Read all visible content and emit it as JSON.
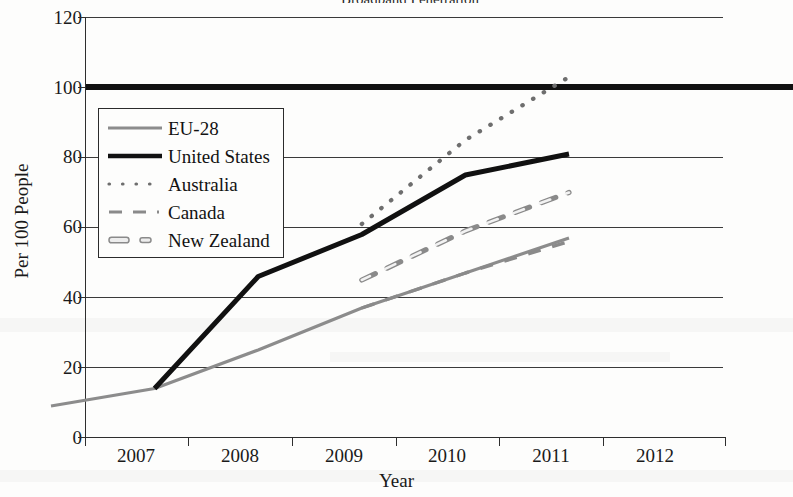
{
  "chart_data": {
    "type": "line",
    "title": "Broadband Penetration",
    "xlabel": "Year",
    "ylabel": "Per 100 People",
    "x": [
      2007,
      2008,
      2009,
      2010,
      2011,
      2012
    ],
    "xticklabels": [
      "2007",
      "2008",
      "2009",
      "2010",
      "2011",
      "2012"
    ],
    "yticklabels": [
      "0",
      "20",
      "40",
      "60",
      "80",
      "100",
      "120"
    ],
    "ytickvalues": [
      0,
      20,
      40,
      60,
      80,
      100,
      120
    ],
    "ylim": [
      0,
      120
    ],
    "xlim": [
      2006.5,
      2012.7
    ],
    "grid": "horizontal",
    "legend_position": "upper-left-inside",
    "reference_line": {
      "label": "100",
      "value": 100,
      "style": "thick-solid-black"
    },
    "series": [
      {
        "name": "EU-28",
        "style": "solid-thin-gray",
        "color": "#8c8c8c",
        "x": [
          2007,
          2008,
          2009,
          2010,
          2011,
          2012
        ],
        "values": [
          4,
          9,
          20,
          32,
          42,
          52
        ]
      },
      {
        "name": "United States",
        "style": "solid-thick-black",
        "color": "#111111",
        "x": [
          2008,
          2009,
          2010,
          2011,
          2012
        ],
        "values": [
          9,
          41,
          53,
          70,
          76
        ]
      },
      {
        "name": "Australia",
        "style": "dotted-gray",
        "color": "#6e6e6e",
        "x": [
          2010,
          2011,
          2012
        ],
        "values": [
          56,
          80,
          98
        ]
      },
      {
        "name": "Canada",
        "style": "dashed-gray",
        "color": "#8a8a8a",
        "x": [
          2010,
          2011,
          2012
        ],
        "values": [
          32,
          42,
          51
        ]
      },
      {
        "name": "New Zealand",
        "style": "dash-outline-gray",
        "color": "#8a8a8a",
        "x": [
          2010,
          2011,
          2012
        ],
        "values": [
          40,
          54,
          65
        ]
      }
    ]
  },
  "legend": {
    "items": [
      {
        "label": "EU-28",
        "swatch": "solid-thin-gray-line-icon"
      },
      {
        "label": "United States",
        "swatch": "solid-thick-black-line-icon"
      },
      {
        "label": "Australia",
        "swatch": "dotted-line-icon"
      },
      {
        "label": "Canada",
        "swatch": "dashed-line-icon"
      },
      {
        "label": "New Zealand",
        "swatch": "dash-outline-line-icon"
      }
    ]
  },
  "axes": {
    "y_title": "Per 100 People",
    "x_title": "Year",
    "y_ticks": [
      "120",
      "100",
      "80",
      "60",
      "40",
      "20",
      "0"
    ],
    "x_ticks": [
      "2007",
      "2008",
      "2009",
      "2010",
      "2011",
      "2012"
    ]
  }
}
